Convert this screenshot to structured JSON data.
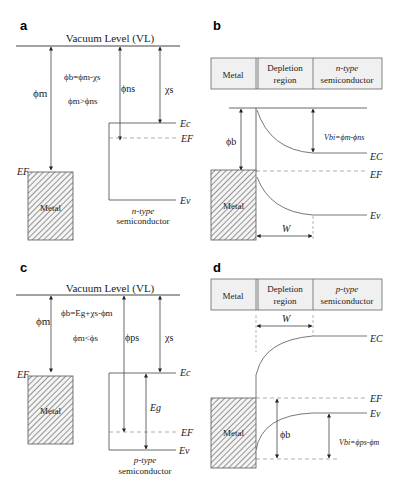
{
  "panels": {
    "a": {
      "label": "a",
      "vacuum_level": "Vacuum Level (VL)",
      "phi_m": "ϕm",
      "eq1": "ϕb=ϕm-χs",
      "eq2": "ϕm>ϕns",
      "phi_ns": "ϕns",
      "chi_s": "χs",
      "ef_metal": "EF",
      "metal": "Metal",
      "ec": "Ec",
      "ef": "EF",
      "ev": "Ev",
      "semi_line1": "n-type",
      "semi_line2": "semiconductor"
    },
    "b": {
      "label": "b",
      "header": [
        "Metal",
        "Depletion region",
        "n-type semiconductor"
      ],
      "header_depl_1": "Depletion",
      "header_depl_2": "region",
      "header_semi_1": "n-type",
      "header_semi_2": "semiconductor",
      "phi_b": "ϕb",
      "vbi": "Vbi=ϕm-ϕns",
      "ec": "EC",
      "ef": "EF",
      "ev": "Ev",
      "metal": "Metal",
      "w": "W"
    },
    "c": {
      "label": "c",
      "vacuum_level": "Vacuum Level (VL)",
      "phi_m": "ϕm",
      "eq1": "ϕb=Eg+χs-ϕm",
      "eq2": "ϕm<ϕs",
      "phi_ps": "ϕps",
      "chi_s": "χs",
      "ef_metal": "EF",
      "metal": "Metal",
      "ec": "Ec",
      "eg": "Eg",
      "ef": "EF",
      "ev": "Ev",
      "semi_line1": "p-type",
      "semi_line2": "semiconductor"
    },
    "d": {
      "label": "d",
      "header": [
        "Metal",
        "Depletion region",
        "p-type semiconductor"
      ],
      "header_depl_1": "Depletion",
      "header_depl_2": "region",
      "header_semi_1": "p-type",
      "header_semi_2": "semiconductor",
      "w": "W",
      "ec": "EC",
      "ef": "EF",
      "ev": "Ev",
      "phi_b": "ϕb",
      "vbi": "Vbi=ϕps-ϕm",
      "metal": "Metal"
    }
  }
}
